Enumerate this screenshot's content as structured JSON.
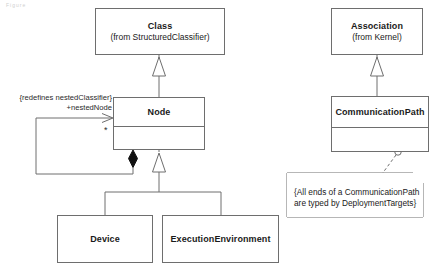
{
  "diagram": {
    "type": "uml-class-diagram",
    "corner_mark": "Figure",
    "line_color": "#6e6e6e",
    "text_color": "#1a1a1a",
    "background": "#ffffff"
  },
  "classes": [
    {
      "id": "class",
      "name": "Class",
      "from": "(from StructuredClassifier)",
      "x": 95,
      "y": 8,
      "w": 130,
      "h": 47,
      "compartments": 1
    },
    {
      "id": "node",
      "name": "Node",
      "from": "",
      "x": 113,
      "y": 97,
      "w": 92,
      "h": 53,
      "compartments": 2
    },
    {
      "id": "device",
      "name": "Device",
      "from": "",
      "x": 57,
      "y": 215,
      "w": 96,
      "h": 48,
      "compartments": 1
    },
    {
      "id": "executionenvironment",
      "name": "ExecutionEnvironment",
      "from": "",
      "x": 162,
      "y": 215,
      "w": 117,
      "h": 48,
      "compartments": 1
    },
    {
      "id": "association",
      "name": "Association",
      "from": "(from Kernel)",
      "x": 331,
      "y": 8,
      "w": 92,
      "h": 47,
      "compartments": 1
    },
    {
      "id": "communicationpath",
      "name": "CommunicationPath",
      "from": "",
      "x": 331,
      "y": 96,
      "w": 98,
      "h": 56,
      "compartments": 2
    }
  ],
  "labels": {
    "redefines": "{redefines nestedClassifier}",
    "role_end": "+nestedNode",
    "multiplicity": "*"
  },
  "note": {
    "id": "communicationpath-constraint",
    "text_line1": "{All ends of a CommunicationPath",
    "text_line2": "are typed by DeploymentTargets}",
    "x": 287,
    "y": 173,
    "w": 136,
    "h": 44,
    "fold": 10
  },
  "relationships": [
    {
      "kind": "generalization",
      "from": "node",
      "to": "class"
    },
    {
      "kind": "generalization",
      "from": "device",
      "to": "node"
    },
    {
      "kind": "generalization",
      "from": "executionenvironment",
      "to": "node"
    },
    {
      "kind": "generalization",
      "from": "communicationpath",
      "to": "association"
    },
    {
      "kind": "composition",
      "from": "node",
      "to": "node",
      "end_label": "+nestedNode",
      "end_multiplicity": "*",
      "constraint": "{redefines nestedClassifier}"
    },
    {
      "kind": "note-anchor",
      "from": "communicationpath-constraint",
      "to": "communicationpath"
    }
  ]
}
